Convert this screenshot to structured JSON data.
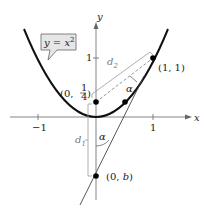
{
  "diagram": {
    "equation_label": {
      "lhs": "y",
      "eq": " = ",
      "base": "x",
      "exp": "2"
    },
    "axes": {
      "x_label": "x",
      "y_label": "y"
    },
    "ticks": {
      "x_neg": "−1",
      "x_pos": "1",
      "y_pos": "1"
    },
    "points": {
      "focus": {
        "label_open": "(0, ",
        "num": "1",
        "den": "4",
        "label_close": ")"
      },
      "tangent_point": {
        "label": "(1, 1)"
      },
      "intercept": {
        "label_open": "(0, ",
        "var": "b",
        "label_close": ")"
      }
    },
    "distances": {
      "d1": "d",
      "d1_sub": "1",
      "d2": "d",
      "d2_sub": "2"
    },
    "angles": {
      "alpha_upper": "α",
      "alpha_lower": "α"
    },
    "colors": {
      "curve": "#111111",
      "axis": "#555555",
      "bracket": "#888888",
      "callout_fill": "#e6e6e6"
    }
  }
}
